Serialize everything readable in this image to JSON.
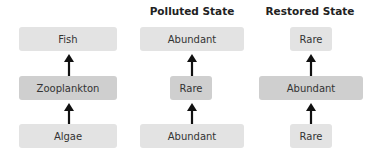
{
  "columns": [
    {
      "title": "",
      "top": {
        "label": "Fish",
        "shade": "light"
      },
      "middle": {
        "label": "Zooplankton",
        "shade": "dark"
      },
      "bottom": {
        "label": "Algae",
        "shade": "light"
      }
    },
    {
      "title": "Polluted State",
      "top": {
        "label": "Abundant",
        "shade": "light"
      },
      "middle": {
        "label": "Rare",
        "shade": "dark"
      },
      "bottom": {
        "label": "Abundant",
        "shade": "light"
      }
    },
    {
      "title": "Restored State",
      "top": {
        "label": "Rare",
        "shade": "light"
      },
      "middle": {
        "label": "Abundant",
        "shade": "dark"
      },
      "bottom": {
        "label": "Rare",
        "shade": "light"
      }
    }
  ],
  "colors": {
    "light_box": "#e3e3e3",
    "dark_box": "#cfcfcf",
    "arrow": "#111111"
  }
}
